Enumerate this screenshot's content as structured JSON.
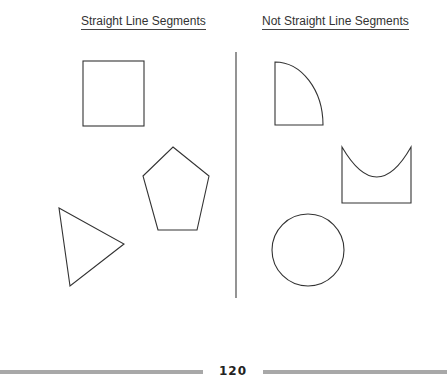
{
  "headings": {
    "left": "Straight Line Segments",
    "right": "Not Straight Line Segments"
  },
  "shapes": {
    "straight": [
      "square",
      "pentagon",
      "triangle"
    ],
    "not_straight": [
      "quarter-circle",
      "u-shape",
      "circle"
    ]
  },
  "footer": {
    "page_number": "120"
  },
  "colors": {
    "stroke": "#333333",
    "divider": "#666666",
    "footer_bar": "#a8a8a8"
  }
}
